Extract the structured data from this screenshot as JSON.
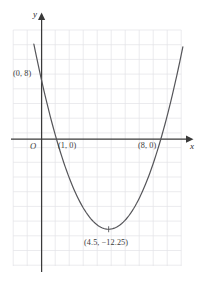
{
  "figure": {
    "background_color": "#ffffff",
    "grid_color": "#e2e2e6",
    "axis_color": "#3a3a3a",
    "curve_color": "#555559",
    "label_color": "#3a3a3a"
  },
  "axes": {
    "x_axis_label": "x",
    "y_axis_label": "y",
    "origin_label": "O",
    "x_arrow": "arrow-right",
    "y_arrow": "arrow-up"
  },
  "labels": {
    "y_intercept": "(0, 8)",
    "root_left": "(1, 0)",
    "root_right": "(8, 0)",
    "vertex": "(4.5, −12.25)"
  },
  "chart_data": {
    "type": "line",
    "title": "",
    "xlabel": "x",
    "ylabel": "y",
    "grid": true,
    "legend": "none",
    "xlim": [
      -2,
      11
    ],
    "ylim": [
      -16,
      9
    ],
    "grid_step": 1,
    "equation": "y = x^2 - 9x + 8",
    "series": [
      {
        "name": "y = x^2 - 9x + 8",
        "x": [
          -0.5,
          0,
          0.5,
          1,
          1.5,
          2,
          2.5,
          3,
          3.5,
          4,
          4.5,
          5,
          5.5,
          6,
          6.5,
          7,
          7.5,
          8,
          8.5,
          9,
          9.5
        ],
        "values": [
          12.75,
          8,
          3.75,
          0,
          -3.25,
          -6,
          -8.25,
          -10,
          -11.25,
          -12,
          -12.25,
          -12,
          -11.25,
          -10,
          -8.25,
          -6,
          -3.25,
          0,
          3.75,
          8,
          12.75
        ]
      }
    ],
    "annotations": [
      {
        "label": "(0, 8)",
        "x": 0,
        "y": 8
      },
      {
        "label": "(1, 0)",
        "x": 1,
        "y": 0
      },
      {
        "label": "(8, 0)",
        "x": 8,
        "y": 0
      },
      {
        "label": "(4.5, −12.25)",
        "x": 4.5,
        "y": -12.25
      }
    ]
  }
}
